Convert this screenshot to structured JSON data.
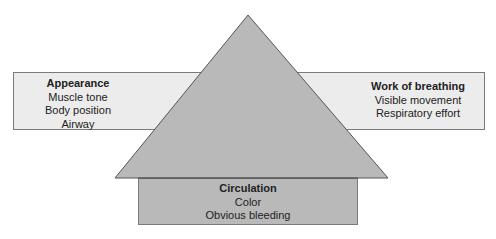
{
  "diagram": {
    "type": "pediatric-assessment-triangle",
    "colors": {
      "side_box_fill": "#ececec",
      "triangle_fill": "#b9b9b9",
      "border": "#555555"
    },
    "left": {
      "title": "Appearance",
      "items": [
        "Muscle tone",
        "Body position",
        "Airway"
      ]
    },
    "right": {
      "title": "Work of breathing",
      "items": [
        "Visible movement",
        "Respiratory effort"
      ]
    },
    "bottom": {
      "title": "Circulation",
      "items": [
        "Color",
        "Obvious bleeding"
      ]
    }
  }
}
